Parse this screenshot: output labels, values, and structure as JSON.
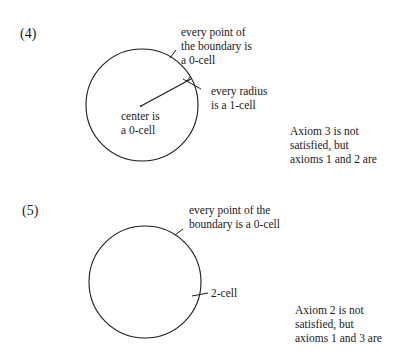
{
  "figures": [
    {
      "number": "(4)",
      "labels": {
        "boundary": [
          "every point of",
          "the boundary is",
          "a 0-cell"
        ],
        "radius": [
          "every radius",
          "is a 1-cell"
        ],
        "center": [
          "center is",
          "a 0-cell"
        ]
      },
      "caption": [
        "Axiom 3 is not",
        "satisfied, but",
        "axioms 1 and 2 are"
      ]
    },
    {
      "number": "(5)",
      "labels": {
        "boundary": [
          "every point of the",
          "boundary is a 0-cell"
        ],
        "interior": [
          "2-cell"
        ]
      },
      "caption": [
        "Axiom 2 is not",
        "satisfied, but",
        "axioms 1 and 3 are"
      ]
    }
  ]
}
